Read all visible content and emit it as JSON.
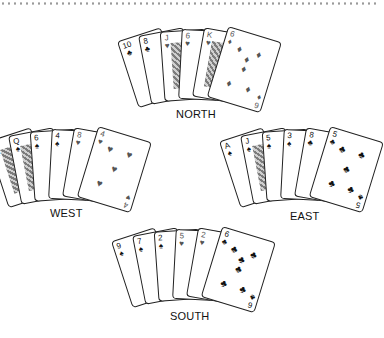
{
  "hands": {
    "north": {
      "label": "NORTH",
      "cards": [
        {
          "rank": "10",
          "suit": "♣",
          "color": "black"
        },
        {
          "rank": "8",
          "suit": "♣",
          "color": "black"
        },
        {
          "rank": "J",
          "suit": "♥",
          "color": "red"
        },
        {
          "rank": "6",
          "suit": "♥",
          "color": "red"
        },
        {
          "rank": "K",
          "suit": "♥",
          "color": "red"
        },
        {
          "rank": "6",
          "suit": "♦",
          "color": "red"
        }
      ]
    },
    "west": {
      "label": "WEST",
      "cards": [
        {
          "rank": "K",
          "suit": "♣",
          "color": "black"
        },
        {
          "rank": "Q",
          "suit": "♠",
          "color": "black"
        },
        {
          "rank": "6",
          "suit": "♠",
          "color": "black"
        },
        {
          "rank": "4",
          "suit": "♠",
          "color": "black"
        },
        {
          "rank": "8",
          "suit": "♥",
          "color": "red"
        },
        {
          "rank": "4",
          "suit": "♥",
          "color": "red"
        }
      ]
    },
    "east": {
      "label": "EAST",
      "cards": [
        {
          "rank": "A",
          "suit": "♠",
          "color": "black"
        },
        {
          "rank": "J",
          "suit": "♠",
          "color": "black"
        },
        {
          "rank": "5",
          "suit": "♠",
          "color": "black"
        },
        {
          "rank": "3",
          "suit": "♠",
          "color": "black"
        },
        {
          "rank": "8",
          "suit": "♣",
          "color": "black"
        },
        {
          "rank": "5",
          "suit": "♣",
          "color": "black"
        }
      ]
    },
    "south": {
      "label": "SOUTH",
      "cards": [
        {
          "rank": "9",
          "suit": "♠",
          "color": "black"
        },
        {
          "rank": "7",
          "suit": "♠",
          "color": "black"
        },
        {
          "rank": "2",
          "suit": "♠",
          "color": "black"
        },
        {
          "rank": "5",
          "suit": "♥",
          "color": "red"
        },
        {
          "rank": "2",
          "suit": "♥",
          "color": "red"
        },
        {
          "rank": "6",
          "suit": "♣",
          "color": "black"
        }
      ]
    }
  }
}
